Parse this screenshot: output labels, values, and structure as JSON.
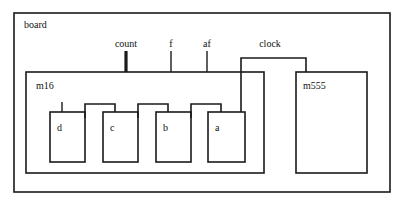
{
  "diagram": {
    "kind": "block-diagram",
    "background_color": "#ffffff",
    "line_color": "#1a1a1a",
    "text_color": "#111111",
    "canvas": {
      "width": 408,
      "height": 207
    },
    "outer": {
      "label": "board",
      "label_x": 24,
      "label_y": 28,
      "rect": {
        "x": 14,
        "y": 13,
        "w": 376,
        "h": 179
      },
      "stroke_width": 1.6
    },
    "modules": [
      {
        "id": "m16",
        "label": "m16",
        "label_x": 36,
        "label_y": 89,
        "rect": {
          "x": 26,
          "y": 72,
          "w": 238,
          "h": 101
        },
        "stroke_width": 1.6
      },
      {
        "id": "m555",
        "label": "m555",
        "label_x": 303,
        "label_y": 89,
        "rect": {
          "x": 296,
          "y": 72,
          "w": 71,
          "h": 101
        },
        "stroke_width": 1.6
      }
    ],
    "flipflops": [
      {
        "id": "d",
        "label": "d",
        "label_x": 57,
        "label_y": 131,
        "rect": {
          "x": 50,
          "y": 112,
          "w": 35,
          "h": 50
        },
        "stroke_width": 1.6
      },
      {
        "id": "c",
        "label": "c",
        "label_x": 110,
        "label_y": 131,
        "rect": {
          "x": 103,
          "y": 112,
          "w": 35,
          "h": 50
        },
        "stroke_width": 1.6
      },
      {
        "id": "b",
        "label": "b",
        "label_x": 163,
        "label_y": 131,
        "rect": {
          "x": 156,
          "y": 112,
          "w": 35,
          "h": 50
        },
        "stroke_width": 1.6
      },
      {
        "id": "a",
        "label": "a",
        "label_x": 215,
        "label_y": 131,
        "rect": {
          "x": 208,
          "y": 112,
          "w": 37,
          "h": 50
        },
        "stroke_width": 1.6
      }
    ],
    "port_labels": [
      {
        "id": "count",
        "label": "count",
        "x": 126,
        "y": 47
      },
      {
        "id": "f",
        "label": "f",
        "x": 171,
        "y": 47
      },
      {
        "id": "af",
        "label": "af",
        "x": 207,
        "y": 47
      },
      {
        "id": "clock",
        "label": "clock",
        "x": 270,
        "y": 47
      }
    ],
    "wires": [
      {
        "id": "count-stub",
        "path": "M 126 51 L 126 72",
        "stroke_width": 3.2
      },
      {
        "id": "f-stub",
        "path": "M 171 51 L 171 72",
        "stroke_width": 1.4
      },
      {
        "id": "af-stub",
        "path": "M 207 51 L 207 72",
        "stroke_width": 1.4
      },
      {
        "id": "clock-bus",
        "path": "M 241 112 L 241 58 L 306 58 L 306 72",
        "stroke_width": 1.6
      },
      {
        "id": "d-clock-stub",
        "path": "M 62 102 L 62 112",
        "stroke_width": 1.4
      },
      {
        "id": "d-to-c-jumper",
        "path": "M 85 118 L 85 104 L 115 104 L 115 112",
        "stroke_width": 1.6
      },
      {
        "id": "c-to-b-jumper",
        "path": "M 138 118 L 138 104 L 168 104 L 168 112",
        "stroke_width": 1.6
      },
      {
        "id": "b-to-a-jumper",
        "path": "M 191 118 L 191 104 L 221 104 L 221 112",
        "stroke_width": 1.6
      }
    ]
  }
}
